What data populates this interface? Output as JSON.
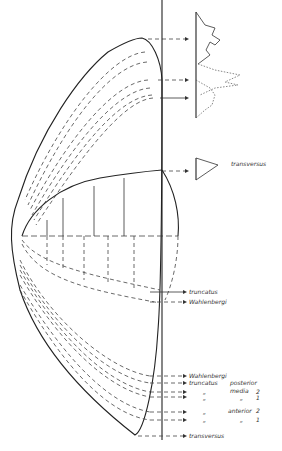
{
  "figure": {
    "type": "anatomical scale-growth diagram",
    "labels": {
      "transversus_top": "transversus",
      "truncatus_mid": "truncatus",
      "wahlenbergi_mid": "Wahlenbergi",
      "wahlenbergi_low": "Wahlenbergi",
      "truncatus_low": "truncatus",
      "posterior": "posterior",
      "media": "media",
      "media_2": "2",
      "ditto_1": "„",
      "ditto_2": "„",
      "ditto_3": "„",
      "ditto_4": "„",
      "ditto_5": "„",
      "ditto_6": "„",
      "num_1a": "1",
      "anterior": "anterior",
      "anterior_2": "2",
      "num_1b": "1",
      "transversus_bottom": "transversus"
    }
  }
}
